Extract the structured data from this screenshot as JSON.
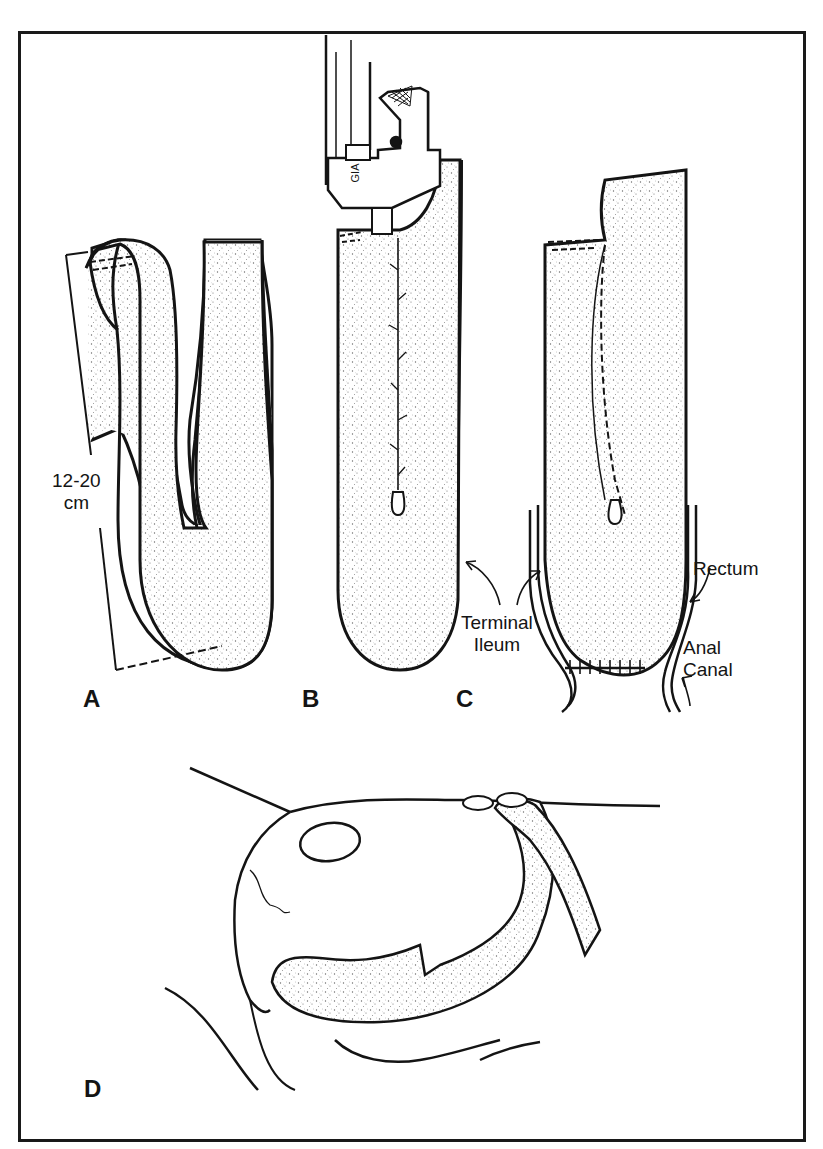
{
  "figure": {
    "panels": [
      {
        "id": "A",
        "letter": "A"
      },
      {
        "id": "B",
        "letter": "B"
      },
      {
        "id": "C",
        "letter": "C"
      },
      {
        "id": "D",
        "letter": "D"
      }
    ],
    "annotations": {
      "length_measure": {
        "line1": "12-20",
        "line2": "cm"
      },
      "terminal_ileum": {
        "line1": "Terminal",
        "line2": "Ileum"
      },
      "rectum": "Rectum",
      "anal_canal": {
        "line1": "Anal",
        "line2": "Canal"
      },
      "stapler_label": "GIA"
    },
    "colors": {
      "ink": "#141414",
      "background": "#ffffff",
      "stipple": "#6a6a6a"
    }
  }
}
